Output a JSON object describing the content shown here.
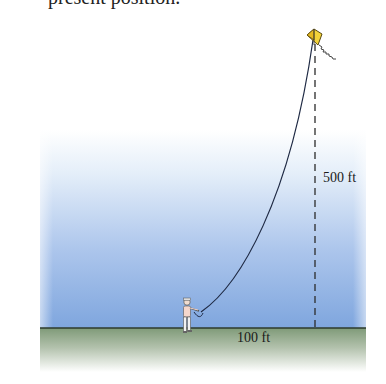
{
  "caption": {
    "text": "present position."
  },
  "diagram": {
    "labels": {
      "height": "500 ft",
      "horizontal_distance": "100 ft"
    },
    "elements": {
      "kite": {
        "color": "#f2d23a",
        "outline": "#5a4a10"
      },
      "string": {
        "color": "#1f2a44"
      },
      "person": {
        "shirt": "#f4d6cc",
        "pants": "#f2f2f2"
      },
      "vertical_dashed_line": {
        "color": "#2b2b2b"
      },
      "ground_line": {
        "color": "#2d3a2d"
      }
    },
    "colors": {
      "sky_top": "#ffffff",
      "sky_bottom": "#7fa6de",
      "ground_top": "#8ea585",
      "ground_bottom": "#ffffff"
    }
  }
}
